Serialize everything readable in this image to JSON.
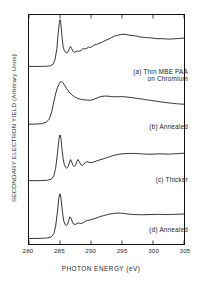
{
  "figure": {
    "ylabel": "SECONDARY ELECTRON YIELD (Arbitrary Units)",
    "xlabel": "PHOTON ENERGY (eV)"
  },
  "chart_data": {
    "type": "line",
    "title": "",
    "xlabel": "PHOTON ENERGY (eV)",
    "ylabel": "SECONDARY ELECTRON YIELD (Arbitrary Units)",
    "xlim": [
      280,
      305
    ],
    "xticks": [
      280,
      285,
      290,
      295,
      300,
      305
    ],
    "xticklabels": [
      "280",
      "285",
      "290",
      "295",
      "300",
      "305"
    ],
    "ylim": [
      0,
      1
    ],
    "yticks": [],
    "grid": false,
    "legend_position": "inline-right",
    "line_color": "#111111",
    "series": [
      {
        "name": "(a) Thin MBE PAA on Chromium",
        "label_lines": [
          "(a) Thin MBE PAA",
          "on Chromium"
        ],
        "x": [
          280.0,
          281.0,
          282.0,
          283.0,
          283.5,
          283.9,
          284.2,
          284.5,
          284.7,
          284.9,
          285.0,
          285.1,
          285.2,
          285.35,
          285.5,
          285.7,
          285.9,
          286.1,
          286.3,
          286.5,
          286.7,
          286.9,
          287.1,
          287.3,
          287.5,
          287.8,
          288.1,
          288.4,
          288.7,
          289.0,
          289.3,
          289.6,
          289.9,
          290.2,
          290.5,
          290.9,
          291.3,
          291.7,
          292.1,
          292.5,
          292.9,
          293.3,
          293.8,
          294.3,
          294.8,
          295.3,
          295.8,
          296.3,
          296.8,
          297.3,
          297.8,
          298.3,
          298.8,
          299.3,
          299.8,
          300.3,
          300.8,
          301.3,
          301.8,
          302.3,
          302.8,
          303.3,
          303.8,
          304.3,
          304.8,
          305.0
        ],
        "y": [
          0.055,
          0.055,
          0.056,
          0.06,
          0.07,
          0.1,
          0.19,
          0.4,
          0.7,
          0.905,
          0.96,
          0.93,
          0.8,
          0.6,
          0.44,
          0.36,
          0.33,
          0.32,
          0.34,
          0.4,
          0.44,
          0.4,
          0.345,
          0.33,
          0.34,
          0.355,
          0.35,
          0.365,
          0.4,
          0.395,
          0.405,
          0.43,
          0.425,
          0.44,
          0.47,
          0.48,
          0.505,
          0.52,
          0.545,
          0.57,
          0.59,
          0.615,
          0.645,
          0.66,
          0.675,
          0.68,
          0.672,
          0.66,
          0.655,
          0.645,
          0.63,
          0.622,
          0.615,
          0.612,
          0.608,
          0.6,
          0.592,
          0.596,
          0.59,
          0.588,
          0.585,
          0.59,
          0.595,
          0.6,
          0.604,
          0.606
        ]
      },
      {
        "name": "(b) Annealed",
        "label_lines": [
          "(b) Annealed"
        ],
        "x": [
          280.0,
          281.0,
          282.0,
          282.8,
          283.3,
          283.7,
          284.0,
          284.3,
          284.6,
          284.9,
          285.1,
          285.3,
          285.5,
          285.8,
          286.1,
          286.5,
          286.9,
          287.3,
          287.8,
          288.3,
          288.8,
          289.3,
          289.8,
          290.3,
          290.8,
          291.3,
          291.8,
          292.3,
          292.8,
          293.3,
          293.8,
          294.3,
          294.8,
          295.3,
          295.8,
          296.3,
          296.8,
          297.3,
          297.8,
          298.3,
          298.8,
          299.3,
          299.8,
          300.3,
          300.8,
          301.3,
          301.8,
          302.3,
          302.8,
          303.3,
          303.8,
          304.3,
          304.8,
          305.0
        ],
        "y": [
          0.045,
          0.048,
          0.055,
          0.085,
          0.15,
          0.3,
          0.48,
          0.64,
          0.76,
          0.84,
          0.872,
          0.87,
          0.845,
          0.79,
          0.73,
          0.665,
          0.615,
          0.58,
          0.55,
          0.53,
          0.52,
          0.513,
          0.51,
          0.52,
          0.545,
          0.57,
          0.585,
          0.592,
          0.588,
          0.58,
          0.578,
          0.578,
          0.58,
          0.578,
          0.572,
          0.565,
          0.556,
          0.548,
          0.54,
          0.532,
          0.522,
          0.513,
          0.505,
          0.496,
          0.486,
          0.478,
          0.47,
          0.462,
          0.455,
          0.448,
          0.442,
          0.438,
          0.434,
          0.432
        ]
      },
      {
        "name": "(c) Thicker",
        "label_lines": [
          "(c) Thicker"
        ],
        "x": [
          280.0,
          281.0,
          282.0,
          283.0,
          283.6,
          284.0,
          284.3,
          284.6,
          284.8,
          284.95,
          285.05,
          285.15,
          285.3,
          285.5,
          285.7,
          285.9,
          286.1,
          286.3,
          286.5,
          286.7,
          286.9,
          287.1,
          287.3,
          287.5,
          287.7,
          287.9,
          288.1,
          288.35,
          288.6,
          288.85,
          289.1,
          289.4,
          289.7,
          290.0,
          290.4,
          290.8,
          291.2,
          291.6,
          292.0,
          292.5,
          293.0,
          293.5,
          294.0,
          294.5,
          295.0,
          295.5,
          296.0,
          296.5,
          297.0,
          297.5,
          298.0,
          298.5,
          299.0,
          299.5,
          300.0,
          300.5,
          301.0,
          301.5,
          302.0,
          302.5,
          303.0,
          303.5,
          304.0,
          304.5,
          305.0
        ],
        "y": [
          0.06,
          0.06,
          0.062,
          0.07,
          0.09,
          0.15,
          0.3,
          0.6,
          0.84,
          0.94,
          0.945,
          0.88,
          0.7,
          0.49,
          0.37,
          0.32,
          0.3,
          0.33,
          0.4,
          0.47,
          0.42,
          0.36,
          0.335,
          0.36,
          0.43,
          0.47,
          0.43,
          0.37,
          0.355,
          0.38,
          0.42,
          0.43,
          0.415,
          0.41,
          0.42,
          0.44,
          0.455,
          0.47,
          0.485,
          0.505,
          0.525,
          0.545,
          0.56,
          0.572,
          0.58,
          0.585,
          0.588,
          0.59,
          0.588,
          0.585,
          0.582,
          0.578,
          0.576,
          0.574,
          0.575,
          0.578,
          0.58,
          0.58,
          0.578,
          0.576,
          0.578,
          0.582,
          0.586,
          0.59,
          0.592
        ]
      },
      {
        "name": "(d) Annealed",
        "label_lines": [
          "(d) Annealed"
        ],
        "x": [
          280.0,
          281.0,
          282.0,
          283.0,
          283.6,
          284.0,
          284.3,
          284.6,
          284.8,
          284.95,
          285.05,
          285.2,
          285.4,
          285.6,
          285.8,
          286.0,
          286.2,
          286.4,
          286.6,
          286.8,
          287.0,
          287.2,
          287.4,
          287.6,
          287.9,
          288.2,
          288.5,
          288.8,
          289.1,
          289.4,
          289.7,
          290.0,
          290.4,
          290.8,
          291.2,
          291.6,
          292.0,
          292.4,
          292.8,
          293.2,
          293.6,
          294.0,
          294.4,
          294.8,
          295.2,
          295.6,
          296.0,
          296.5,
          297.0,
          297.5,
          298.0,
          298.5,
          299.0,
          299.5,
          300.0,
          300.5,
          301.0,
          301.5,
          302.0,
          302.5,
          303.0,
          303.5,
          304.0,
          304.5,
          305.0
        ],
        "y": [
          0.05,
          0.05,
          0.052,
          0.06,
          0.08,
          0.14,
          0.29,
          0.58,
          0.82,
          0.915,
          0.91,
          0.79,
          0.56,
          0.39,
          0.32,
          0.3,
          0.32,
          0.4,
          0.47,
          0.44,
          0.37,
          0.33,
          0.32,
          0.33,
          0.35,
          0.345,
          0.34,
          0.36,
          0.385,
          0.4,
          0.405,
          0.415,
          0.43,
          0.445,
          0.462,
          0.478,
          0.492,
          0.505,
          0.518,
          0.528,
          0.535,
          0.54,
          0.542,
          0.54,
          0.536,
          0.53,
          0.524,
          0.518,
          0.514,
          0.512,
          0.51,
          0.51,
          0.512,
          0.514,
          0.516,
          0.518,
          0.518,
          0.516,
          0.514,
          0.514,
          0.516,
          0.518,
          0.52,
          0.522,
          0.524
        ]
      }
    ]
  }
}
